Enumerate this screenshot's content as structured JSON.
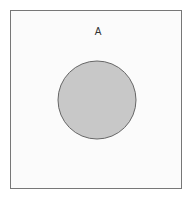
{
  "diagram": {
    "type": "venn",
    "universe": {
      "label": "",
      "border_color": "#777777",
      "fill": "#fbfbfb"
    },
    "sets": [
      {
        "label": "A",
        "shaded": true,
        "fill": "#c8c8c8",
        "stroke": "#666666"
      }
    ]
  }
}
